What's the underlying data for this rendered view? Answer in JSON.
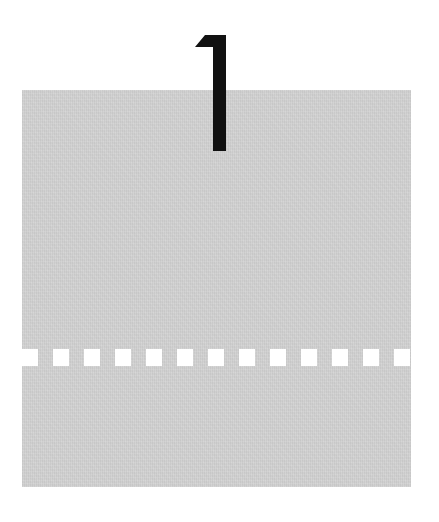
{
  "marker": {
    "numeral": "1",
    "numeral_color": "#111111"
  },
  "panel": {
    "background_color": "#cfcfcf",
    "texture": "paper-grain"
  },
  "perforation": {
    "count": 13,
    "square_color": "#ffffff",
    "start_x": 0,
    "pitch": 31,
    "square_width": 16,
    "square_height": 17
  }
}
